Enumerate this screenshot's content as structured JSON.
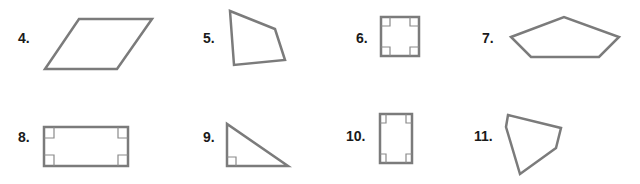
{
  "problems": [
    {
      "number": "4.",
      "label": "4.",
      "shape": "parallelogram",
      "right_angle_marks": 0
    },
    {
      "number": "5.",
      "label": "5.",
      "shape": "quadrilateral",
      "right_angle_marks": 0
    },
    {
      "number": "6.",
      "label": "6.",
      "shape": "square",
      "right_angle_marks": 4
    },
    {
      "number": "7.",
      "label": "7.",
      "shape": "pentagon",
      "right_angle_marks": 0
    },
    {
      "number": "8.",
      "label": "8.",
      "shape": "rectangle",
      "right_angle_marks": 4
    },
    {
      "number": "9.",
      "label": "9.",
      "shape": "right-triangle",
      "right_angle_marks": 1
    },
    {
      "number": "10.",
      "label": "10.",
      "shape": "rectangle",
      "right_angle_marks": 4
    },
    {
      "number": "11.",
      "label": "11.",
      "shape": "pentagon",
      "right_angle_marks": 0
    }
  ],
  "colors": {
    "stroke": "#7b7b7b",
    "label": "#1a1a1a",
    "background": "#ffffff"
  }
}
